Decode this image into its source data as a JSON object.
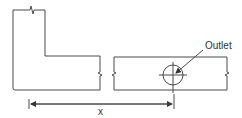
{
  "diagram": {
    "labels": {
      "outlet": "Outlet",
      "dimension": "x"
    },
    "colors": {
      "line": "#4a4a4a",
      "text": "#333333",
      "background": "#ffffff"
    },
    "elements": [
      {
        "type": "l-shaped-duct",
        "break_lines": [
          "top",
          "right"
        ]
      },
      {
        "type": "straight-duct",
        "break_lines": [
          "left",
          "right"
        ]
      },
      {
        "type": "outlet-symbol",
        "shape": "circle-with-crosshair"
      },
      {
        "type": "dimension-line",
        "label": "x",
        "from": "left edge of L-duct",
        "to": "outlet centerline"
      }
    ]
  }
}
